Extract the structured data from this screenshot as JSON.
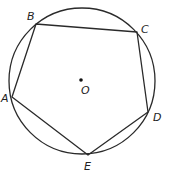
{
  "diagram": {
    "type": "inscribed-pentagon",
    "circle": {
      "cx": 82,
      "cy": 81,
      "r": 73
    },
    "center": {
      "label": "O",
      "x": 81,
      "y": 80
    },
    "vertices": [
      {
        "label": "A",
        "x": 12,
        "y": 97
      },
      {
        "label": "B",
        "x": 36,
        "y": 24
      },
      {
        "label": "C",
        "x": 137,
        "y": 32
      },
      {
        "label": "D",
        "x": 148,
        "y": 112
      },
      {
        "label": "E",
        "x": 88,
        "y": 155
      }
    ],
    "labels": {
      "A": "A",
      "B": "B",
      "C": "C",
      "D": "D",
      "E": "E",
      "O": "O"
    },
    "stroke_color": "#2a2a2a"
  }
}
